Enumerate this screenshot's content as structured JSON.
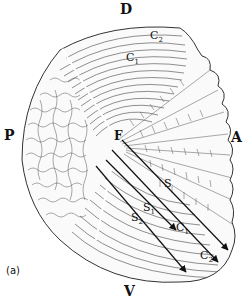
{
  "figure": {
    "panel_label": "(a)",
    "orientation_labels": {
      "dorsal": "D",
      "ventral": "V",
      "posterior": "P",
      "anterior": "A"
    },
    "focus_label": "F",
    "labels": [
      {
        "id": "C1_top",
        "base": "C",
        "sub": "1"
      },
      {
        "id": "C2_top",
        "base": "C",
        "sub": "2"
      },
      {
        "id": "S",
        "base": "S",
        "sub": ""
      },
      {
        "id": "S1",
        "base": "S",
        "sub": "1"
      },
      {
        "id": "S2",
        "base": "S",
        "sub": "2"
      },
      {
        "id": "C1_arrow",
        "base": "C",
        "sub": "1"
      },
      {
        "id": "C2_arrow",
        "base": "C",
        "sub": "2"
      }
    ],
    "arrows": [
      {
        "name": "S",
        "from": [
          122,
          144
        ],
        "to": [
          228,
          250
        ]
      },
      {
        "name": "S1",
        "from": [
          110,
          162
        ],
        "to": [
          176,
          230
        ]
      },
      {
        "name": "S2",
        "from": [
          96,
          168
        ],
        "to": [
          186,
          272
        ]
      },
      {
        "name": "C2",
        "from": [
          132,
          152
        ],
        "to": [
          218,
          258
        ]
      }
    ],
    "colors": {
      "ink": "#111111",
      "hatch": "#555555",
      "background": "#ffffff"
    }
  }
}
